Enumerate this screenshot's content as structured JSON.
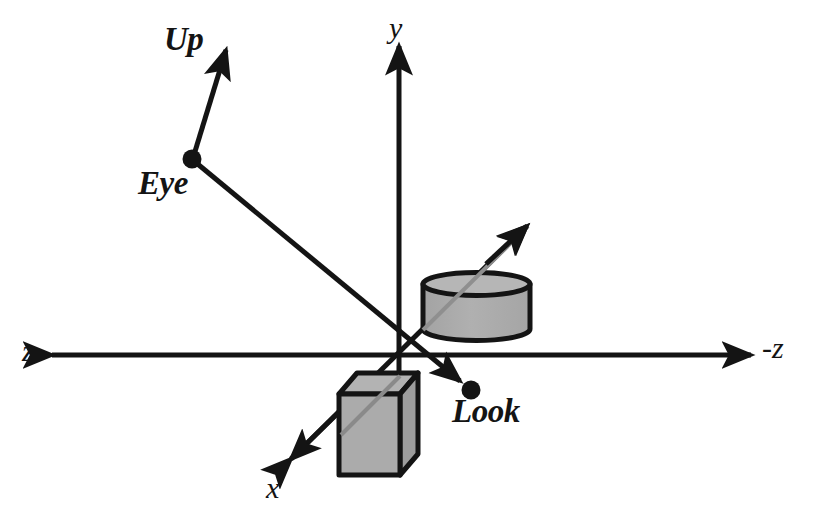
{
  "diagram": {
    "colors": {
      "stroke": "#141414",
      "background": "#ffffff",
      "solid_fill": "#ababab",
      "solid_fill_light": "#b8b8b8",
      "solid_fill_dark": "#9a9a9a"
    },
    "axes": [
      {
        "name": "y-axis",
        "label": "y",
        "direction": "up",
        "tip": [
          398,
          40
        ],
        "origin": [
          400,
          355
        ]
      },
      {
        "name": "z-axis",
        "label": "z",
        "direction": "left",
        "tip": [
          46,
          355
        ],
        "origin": [
          400,
          355
        ]
      },
      {
        "name": "negative-z-axis",
        "label": "-z",
        "direction": "right",
        "tip": [
          757,
          355
        ],
        "origin": [
          400,
          355
        ]
      },
      {
        "name": "x-axis",
        "label": "x",
        "direction": "down-left",
        "tip": [
          284,
          467
        ],
        "origin": [
          400,
          355
        ]
      },
      {
        "name": "negative-x-axis",
        "label": "",
        "direction": "up-right",
        "tip": [
          534,
          218
        ],
        "origin": [
          400,
          355
        ]
      }
    ],
    "vectors": [
      {
        "name": "up-vector",
        "label": "Up",
        "from": [
          192,
          159
        ],
        "to": [
          229,
          39
        ]
      },
      {
        "name": "look-vector",
        "label": "Look",
        "from": [
          192,
          159
        ],
        "to": [
          471,
          390
        ]
      }
    ],
    "points": [
      {
        "name": "eye-point",
        "label": "Eye",
        "at": [
          192,
          159
        ],
        "radius": 9
      },
      {
        "name": "look-point",
        "label": "Look",
        "at": [
          471,
          390
        ],
        "radius": 9
      }
    ],
    "objects": [
      {
        "name": "cylinder",
        "shape": "cylinder",
        "bounds": [
          421,
          274,
          107,
          66
        ]
      },
      {
        "name": "cube",
        "shape": "cube",
        "bounds": [
          339,
          372,
          79,
          103
        ]
      }
    ]
  },
  "labels": {
    "y": "y",
    "z": "z",
    "negative_z": "-z",
    "x": "x",
    "up": "Up",
    "eye": "Eye",
    "look": "Look"
  }
}
